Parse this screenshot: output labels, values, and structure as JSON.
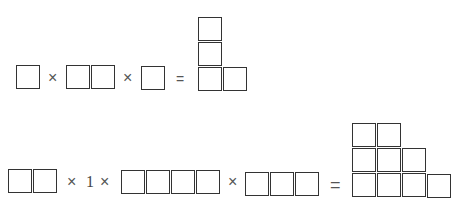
{
  "equation1": {
    "operators": [
      "×",
      "×",
      "="
    ],
    "terms": [
      {
        "shape": "1x1 square",
        "cells": 1
      },
      {
        "shape": "1x2 row",
        "cells": 2
      },
      {
        "shape": "1x1 square",
        "cells": 1
      }
    ],
    "result": {
      "shape": "L-shape (3 tall column + 1 to the right at bottom)",
      "cells": 4
    }
  },
  "equation2": {
    "operators": [
      "×",
      "1",
      "×",
      "×",
      "="
    ],
    "constant": "1",
    "terms": [
      {
        "shape": "1x2 row",
        "cells": 2
      },
      {
        "shape": "1x4 row",
        "cells": 4
      },
      {
        "shape": "1x3 row",
        "cells": 3
      }
    ],
    "result": {
      "shape": "staircase rows 2,3,4",
      "cells": 9
    }
  },
  "colors": {
    "line": "#333333",
    "operator": "#555555",
    "background": "#ffffff"
  }
}
